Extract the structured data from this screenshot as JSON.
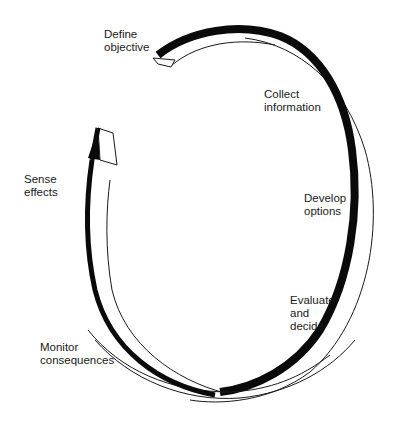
{
  "diagram": {
    "type": "cycle",
    "steps": [
      {
        "id": "define",
        "lines": [
          "Define",
          "objective"
        ]
      },
      {
        "id": "collect",
        "lines": [
          "Collect",
          "information"
        ]
      },
      {
        "id": "develop",
        "lines": [
          "Develop",
          "options"
        ]
      },
      {
        "id": "evaluate",
        "lines": [
          "Evaluate",
          "and",
          "decide"
        ]
      },
      {
        "id": "monitor",
        "lines": [
          "Monitor",
          "consequences"
        ]
      },
      {
        "id": "sense",
        "lines": [
          "Sense",
          "effects"
        ]
      }
    ],
    "colors": {
      "ribbon_dark": "#0a0a0a",
      "ribbon_light": "#ffffff",
      "outline": "#1a1a1a",
      "text": "#1a1a1a",
      "background": "#ffffff"
    }
  }
}
